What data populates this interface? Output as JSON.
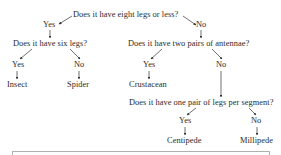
{
  "diagram": {
    "type": "decision-tree",
    "nodes": {
      "q1": "Does it have eight legs or less?",
      "q1_yes": "Yes",
      "q1_no": "No",
      "q2": "Does it have six legs?",
      "q2_yes": "Yes",
      "q2_no": "No",
      "q3": "Does it have two pairs of antennae?",
      "q3_yes": "Yes",
      "q3_no": "No",
      "insect": "Insect",
      "spider": "Spider",
      "crustacean": "Crustacean",
      "q4": "Does it have one pair of legs per segment?",
      "q4_yes": "Yes",
      "q4_no": "No",
      "centipede": "Centipede",
      "millipede": "Millipede"
    },
    "edges": [
      {
        "from": "q1",
        "to": "q1_yes"
      },
      {
        "from": "q1",
        "to": "q1_no"
      },
      {
        "from": "q1_yes",
        "to": "q2"
      },
      {
        "from": "q1_no",
        "to": "q3"
      },
      {
        "from": "q2",
        "to": "q2_yes"
      },
      {
        "from": "q2",
        "to": "q2_no"
      },
      {
        "from": "q2_yes",
        "to": "insect"
      },
      {
        "from": "q2_no",
        "to": "spider"
      },
      {
        "from": "q3",
        "to": "q3_yes"
      },
      {
        "from": "q3",
        "to": "q3_no"
      },
      {
        "from": "q3_yes",
        "to": "crustacean"
      },
      {
        "from": "q3_no",
        "to": "q4"
      },
      {
        "from": "q4",
        "to": "q4_yes"
      },
      {
        "from": "q4",
        "to": "q4_no"
      },
      {
        "from": "q4_yes",
        "to": "centipede"
      },
      {
        "from": "q4_no",
        "to": "millipede"
      }
    ],
    "colors": {
      "text": "#2a2a2a",
      "arrow": "#333333",
      "box_border": "#b0b0b0"
    }
  }
}
